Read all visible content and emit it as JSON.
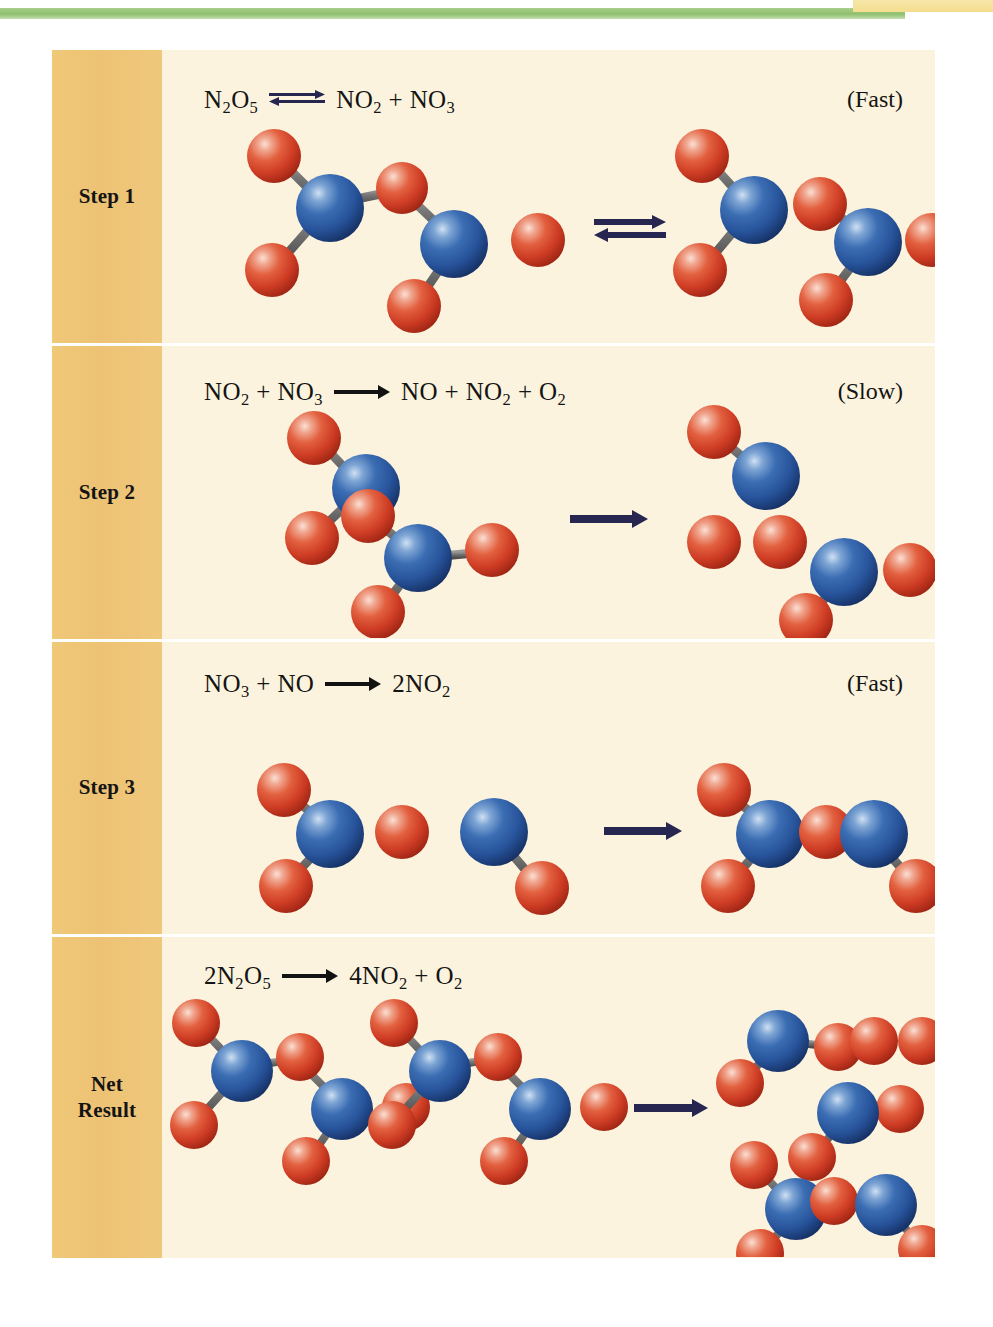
{
  "figure": {
    "background_color": "#fbf3dd",
    "sidebar_color": "#efc576",
    "atom_colors": {
      "nitrogen": "#2c5fa8",
      "oxygen": "#d8452f",
      "bond": "#6a6a6a"
    },
    "arrow_color": "#262650",
    "top_rule_green": "#8fbf6d",
    "top_rule_yellow": "#f3dd8f"
  },
  "rows": [
    {
      "label": "Step 1",
      "label_lines": [
        "Step 1"
      ],
      "equation_text": "N2O5  ⇌  NO2 + NO3",
      "equation_parts": {
        "reactant": "N",
        "r_sub1": "2",
        "r_mid": "O",
        "r_sub2": "5",
        "product_a": "NO",
        "p_a_sub": "2",
        "plus": "+",
        "product_b": "NO",
        "p_b_sub": "3"
      },
      "arrow_type": "equilibrium",
      "rate_label": "(Fast)"
    },
    {
      "label": "Step 2",
      "label_lines": [
        "Step 2"
      ],
      "equation_text": "NO2 + NO3  →  NO + NO2 + O2",
      "arrow_type": "single",
      "rate_label": "(Slow)"
    },
    {
      "label": "Step 3",
      "label_lines": [
        "Step 3"
      ],
      "equation_text": "NO3 + NO  →  2NO2",
      "arrow_type": "single",
      "rate_label": "(Fast)"
    },
    {
      "label": "Net Result",
      "label_lines": [
        "Net",
        "Result"
      ],
      "equation_text": "2N2O5  →  4NO2 + O2",
      "arrow_type": "single",
      "rate_label": ""
    }
  ],
  "molecules": {
    "step1_reactants": [
      "N2O5"
    ],
    "step1_products": [
      "NO2",
      "NO3"
    ],
    "step2_reactants": [
      "NO2",
      "NO3"
    ],
    "step2_products": [
      "NO",
      "O2",
      "NO2"
    ],
    "step3_reactants": [
      "NO3",
      "NO"
    ],
    "step3_products": [
      "NO2",
      "NO2"
    ],
    "net_reactants": [
      "N2O5",
      "N2O5"
    ],
    "net_products": [
      "NO2",
      "O2",
      "NO2",
      "NO2",
      "NO2"
    ]
  }
}
